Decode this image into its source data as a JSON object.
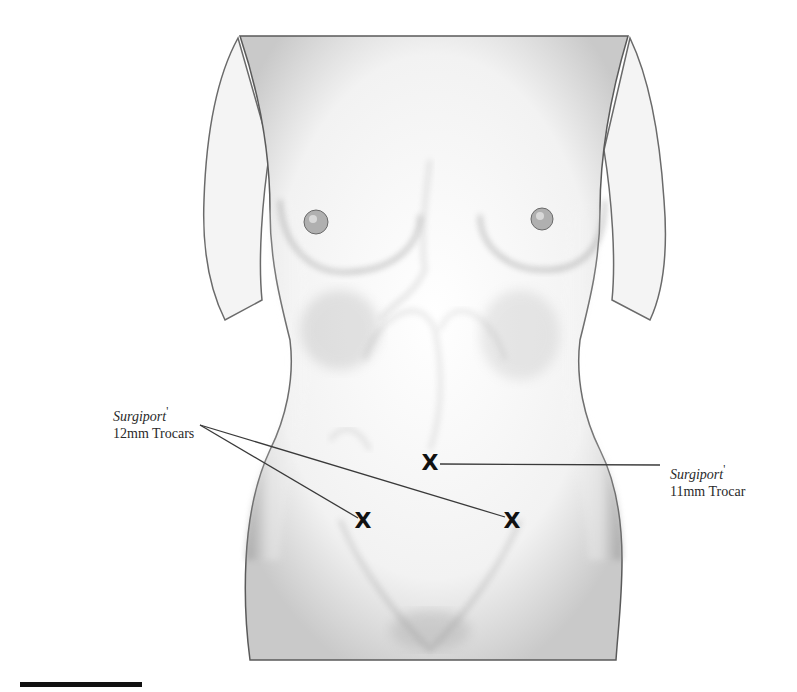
{
  "diagram": {
    "labels": {
      "left": {
        "brand": "Surgiport",
        "mark": "'",
        "text": "12mm Trocars"
      },
      "right": {
        "brand": "Surgiport",
        "mark": "'",
        "text": "11mm Trocar"
      }
    },
    "markers": [
      {
        "id": "umbilical",
        "symbol": "X",
        "x": 430,
        "y": 463,
        "size": "11mm"
      },
      {
        "id": "right-lower-quadrant",
        "symbol": "X",
        "x": 363,
        "y": 521,
        "size": "12mm"
      },
      {
        "id": "left-lower-quadrant",
        "symbol": "X",
        "x": 512,
        "y": 521,
        "size": "12mm"
      }
    ],
    "leaders": [
      {
        "from": [
          200,
          425
        ],
        "to": [
          358,
          518
        ]
      },
      {
        "from": [
          200,
          425
        ],
        "to": [
          505,
          517
        ]
      },
      {
        "from": [
          440,
          464
        ],
        "to": [
          660,
          465
        ]
      }
    ],
    "colors": {
      "ink": "#111111",
      "label_text": "#2a2a2a",
      "skin_shade": "#b8b8b8",
      "background": "#ffffff"
    }
  }
}
